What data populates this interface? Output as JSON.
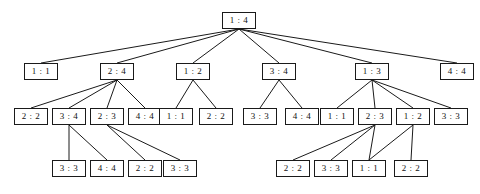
{
  "diagram": {
    "type": "tree",
    "title": "",
    "box": {
      "width": 34,
      "height": 17,
      "font_size": 9,
      "border_color": "#1a1a1a",
      "fill_color": "#ffffff"
    },
    "edge": {
      "color": "#1a1a1a",
      "width": 1
    },
    "nodes": [
      {
        "id": "n0",
        "label": "1 : 4",
        "level": 0,
        "x": 222,
        "y": 12
      },
      {
        "id": "n1",
        "label": "1 : 1",
        "level": 1,
        "x": 24,
        "y": 63
      },
      {
        "id": "n2",
        "label": "2 : 4",
        "level": 1,
        "x": 100,
        "y": 63
      },
      {
        "id": "n3",
        "label": "1 : 2",
        "level": 1,
        "x": 176,
        "y": 63
      },
      {
        "id": "n4",
        "label": "3 : 4",
        "level": 1,
        "x": 262,
        "y": 63
      },
      {
        "id": "n5",
        "label": "1 : 3",
        "level": 1,
        "x": 355,
        "y": 63
      },
      {
        "id": "n6",
        "label": "4 : 4",
        "level": 1,
        "x": 440,
        "y": 63
      },
      {
        "id": "n7",
        "label": "2 : 2",
        "level": 2,
        "x": 14,
        "y": 108
      },
      {
        "id": "n8",
        "label": "3 : 4",
        "level": 2,
        "x": 52,
        "y": 108
      },
      {
        "id": "n9",
        "label": "2 : 3",
        "level": 2,
        "x": 90,
        "y": 108
      },
      {
        "id": "n10",
        "label": "4 : 4",
        "level": 2,
        "x": 128,
        "y": 108
      },
      {
        "id": "n11",
        "label": "1 : 1",
        "level": 2,
        "x": 159,
        "y": 108
      },
      {
        "id": "n12",
        "label": "2 : 2",
        "level": 2,
        "x": 199,
        "y": 108
      },
      {
        "id": "n13",
        "label": "3 : 3",
        "level": 2,
        "x": 243,
        "y": 108
      },
      {
        "id": "n14",
        "label": "4 : 4",
        "level": 2,
        "x": 285,
        "y": 108
      },
      {
        "id": "n15",
        "label": "1 : 1",
        "level": 2,
        "x": 320,
        "y": 108
      },
      {
        "id": "n16",
        "label": "2 : 3",
        "level": 2,
        "x": 358,
        "y": 108
      },
      {
        "id": "n17",
        "label": "1 : 2",
        "level": 2,
        "x": 396,
        "y": 108
      },
      {
        "id": "n18",
        "label": "3 : 3",
        "level": 2,
        "x": 434,
        "y": 108
      },
      {
        "id": "n19",
        "label": "3 : 3",
        "level": 3,
        "x": 52,
        "y": 160
      },
      {
        "id": "n20",
        "label": "4 : 4",
        "level": 3,
        "x": 90,
        "y": 160
      },
      {
        "id": "n21",
        "label": "2 : 2",
        "level": 3,
        "x": 128,
        "y": 160
      },
      {
        "id": "n22",
        "label": "3 : 3",
        "level": 3,
        "x": 163,
        "y": 160
      },
      {
        "id": "n23",
        "label": "2 : 2",
        "level": 3,
        "x": 276,
        "y": 160
      },
      {
        "id": "n24",
        "label": "3 : 3",
        "level": 3,
        "x": 314,
        "y": 160
      },
      {
        "id": "n25",
        "label": "1 : 1",
        "level": 3,
        "x": 352,
        "y": 160
      },
      {
        "id": "n26",
        "label": "2 : 2",
        "level": 3,
        "x": 394,
        "y": 160
      }
    ],
    "edges": [
      {
        "from": "n0",
        "to": "n1"
      },
      {
        "from": "n0",
        "to": "n2"
      },
      {
        "from": "n0",
        "to": "n3"
      },
      {
        "from": "n0",
        "to": "n4"
      },
      {
        "from": "n0",
        "to": "n5"
      },
      {
        "from": "n0",
        "to": "n6"
      },
      {
        "from": "n2",
        "to": "n7"
      },
      {
        "from": "n2",
        "to": "n8"
      },
      {
        "from": "n2",
        "to": "n9"
      },
      {
        "from": "n2",
        "to": "n10"
      },
      {
        "from": "n3",
        "to": "n11"
      },
      {
        "from": "n3",
        "to": "n12"
      },
      {
        "from": "n4",
        "to": "n13"
      },
      {
        "from": "n4",
        "to": "n14"
      },
      {
        "from": "n5",
        "to": "n15"
      },
      {
        "from": "n5",
        "to": "n16"
      },
      {
        "from": "n5",
        "to": "n17"
      },
      {
        "from": "n5",
        "to": "n18"
      },
      {
        "from": "n8",
        "to": "n19"
      },
      {
        "from": "n8",
        "to": "n20"
      },
      {
        "from": "n9",
        "to": "n21"
      },
      {
        "from": "n9",
        "to": "n22"
      },
      {
        "from": "n16",
        "to": "n23"
      },
      {
        "from": "n16",
        "to": "n24"
      },
      {
        "from": "n16",
        "to": "n25"
      },
      {
        "from": "n17",
        "to": "n25"
      },
      {
        "from": "n17",
        "to": "n26"
      }
    ]
  }
}
